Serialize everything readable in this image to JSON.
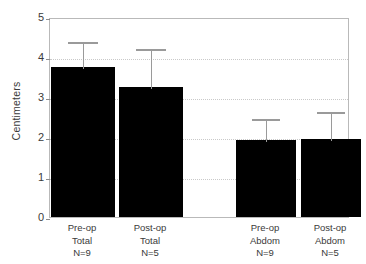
{
  "chart_data": {
    "type": "bar",
    "title": "",
    "subtitle": "",
    "xlabel": "",
    "ylabel": "Centimeters",
    "ylim": [
      0,
      5
    ],
    "yticks": [
      0,
      1,
      2,
      3,
      4,
      5
    ],
    "ytick_labels": [
      "0",
      "1",
      "2",
      "3",
      "4",
      "5"
    ],
    "grid": true,
    "grid_axis": "y",
    "legend": false,
    "legend_position": "none",
    "bar_color": "#000000",
    "error_color": "#9a9a9a",
    "error_direction": "upper-only",
    "categories": [
      "Pre-op Total N=9",
      "Post-op Total N=5",
      "Pre-op Abdom N=9",
      "Post-op Abdom N=5"
    ],
    "values": [
      3.75,
      3.25,
      1.93,
      1.95
    ],
    "error_upper": [
      0.68,
      1.0,
      0.57,
      0.73
    ],
    "error_tops": [
      4.43,
      4.25,
      2.5,
      2.68
    ],
    "group_gap_after_index": 1,
    "tick_labels": [
      {
        "line1": "Pre-op",
        "line2": "Total",
        "line3": "N=9"
      },
      {
        "line1": "Post-op",
        "line2": "Total",
        "line3": "N=5"
      },
      {
        "line1": "Pre-op",
        "line2": "Abdom",
        "line3": "N=9"
      },
      {
        "line1": "Post-op",
        "line2": "Abdom",
        "line3": "N=5"
      }
    ]
  }
}
